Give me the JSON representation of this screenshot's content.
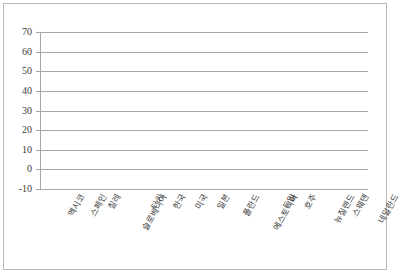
{
  "chart_data": {
    "type": "bar",
    "title": "",
    "xlabel": "",
    "ylabel": "",
    "categories": [
      "멕시코",
      "스페인",
      "칠레",
      "슬로베니아",
      "터키",
      "한국",
      "미국",
      "일본",
      "폴란드",
      "에스토니아",
      "독일",
      "호주",
      "뉴질랜드",
      "스웨덴",
      "네덜란드"
    ],
    "values": [
      65,
      64,
      64,
      59.5,
      57,
      52,
      48,
      45,
      44,
      43,
      40,
      35,
      30,
      20,
      -1
    ],
    "ylim": [
      -10,
      70
    ],
    "ytick_labels": [
      "70",
      "60",
      "50",
      "40",
      "30",
      "20",
      "10",
      "0",
      "-10"
    ],
    "ytick_values": [
      70,
      60,
      50,
      40,
      30,
      20,
      10,
      0,
      -10
    ],
    "grid": true,
    "legend": false,
    "bar_color": "#808080",
    "grid_color": "#a6a6a6",
    "border_color": "#b9b9b9"
  }
}
